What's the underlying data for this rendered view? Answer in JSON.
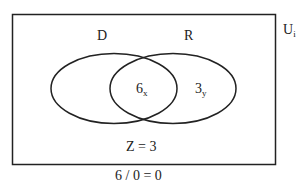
{
  "diagram": {
    "type": "venn",
    "universe_label": {
      "main": "U",
      "sub": "i"
    },
    "sets": [
      {
        "name": "D",
        "label": "D"
      },
      {
        "name": "R",
        "label": "R"
      }
    ],
    "regions": {
      "intersection": {
        "main": "6",
        "sub": "x"
      },
      "r_only": {
        "main": "3",
        "sub": "y"
      }
    },
    "outside_label": "Z = 3",
    "caption": "6 / 0 = 0",
    "colors": {
      "stroke": "#222222",
      "background": "#ffffff"
    }
  }
}
